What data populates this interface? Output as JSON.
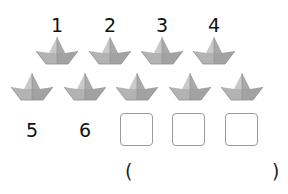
{
  "top_numbers": [
    "1",
    "2",
    "3",
    "4"
  ],
  "row1_boats": 4,
  "row2_boats": 5,
  "bottom_numbers": [
    "5",
    "6"
  ],
  "answer_boxes": [
    "",
    "",
    ""
  ],
  "bracket": {
    "open": "(",
    "close": ")",
    "answer": ""
  },
  "colors": {
    "boat_fill": "#b5b5b5",
    "boat_shade": "#9c9c9c",
    "boat_light": "#d0d0d0",
    "box_border": "#9a9a9a"
  }
}
